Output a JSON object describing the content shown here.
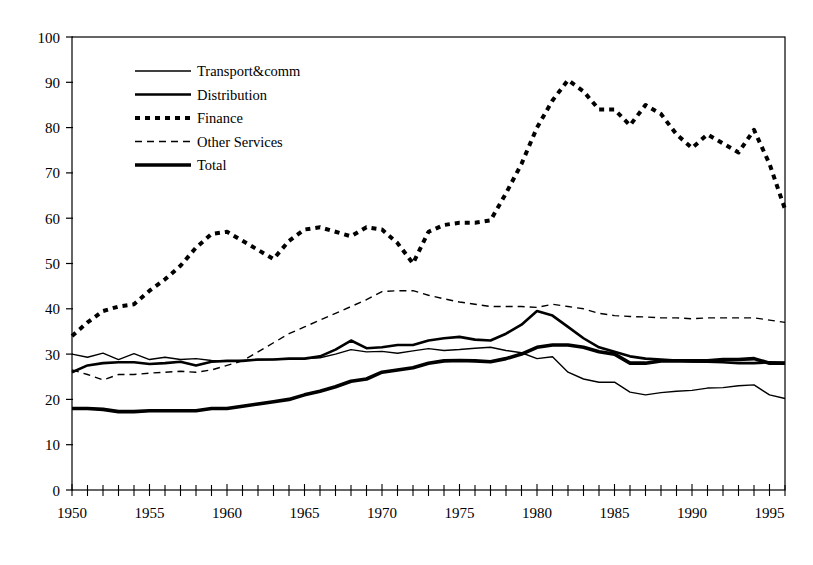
{
  "chart_data": {
    "type": "line",
    "title": "",
    "subtitle": "",
    "xlabel": "",
    "ylabel": "",
    "xlim": [
      1950,
      1996
    ],
    "ylim": [
      0,
      100
    ],
    "grid": false,
    "legend_position": "upper-left-inside",
    "x_tick_labels": [
      "1950",
      "1955",
      "1960",
      "1965",
      "1970",
      "1975",
      "1980",
      "1985",
      "1990",
      "1995"
    ],
    "x_tick_values": [
      1950,
      1955,
      1960,
      1965,
      1970,
      1975,
      1980,
      1985,
      1990,
      1995
    ],
    "x_minor_tick_step": 1,
    "y_tick_labels": [
      "0",
      "10",
      "20",
      "30",
      "40",
      "50",
      "60",
      "70",
      "80",
      "90",
      "100"
    ],
    "y_tick_values": [
      0,
      10,
      20,
      30,
      40,
      50,
      60,
      70,
      80,
      90,
      100
    ],
    "x": [
      1950,
      1951,
      1952,
      1953,
      1954,
      1955,
      1956,
      1957,
      1958,
      1959,
      1960,
      1961,
      1962,
      1963,
      1964,
      1965,
      1966,
      1967,
      1968,
      1969,
      1970,
      1971,
      1972,
      1973,
      1974,
      1975,
      1976,
      1977,
      1978,
      1979,
      1980,
      1981,
      1982,
      1983,
      1984,
      1985,
      1986,
      1987,
      1988,
      1989,
      1990,
      1991,
      1992,
      1993,
      1994,
      1995,
      1996
    ],
    "series": [
      {
        "name": "Transport&comm",
        "style": "solid-thin",
        "color": "#000000",
        "values": [
          30.0,
          29.3,
          30.2,
          28.8,
          30.1,
          28.8,
          29.3,
          28.8,
          29.0,
          28.6,
          28.4,
          28.6,
          28.7,
          28.8,
          28.9,
          29.0,
          29.2,
          30.0,
          31.0,
          30.5,
          30.6,
          30.2,
          30.7,
          31.2,
          30.8,
          31.0,
          31.3,
          31.5,
          30.8,
          30.3,
          29.0,
          29.4,
          26.0,
          24.5,
          23.8,
          23.8,
          21.6,
          21.0,
          21.5,
          21.8,
          22.0,
          22.5,
          22.6,
          23.0,
          23.2,
          21.0,
          20.2
        ]
      },
      {
        "name": "Distribution",
        "style": "solid-medium",
        "color": "#000000",
        "values": [
          26.0,
          27.5,
          28.0,
          28.2,
          28.2,
          27.8,
          28.0,
          28.3,
          27.5,
          28.3,
          28.5,
          28.5,
          28.8,
          28.8,
          29.0,
          29.0,
          29.5,
          31.0,
          33.0,
          31.3,
          31.5,
          32.0,
          32.0,
          33.0,
          33.5,
          33.8,
          33.2,
          33.0,
          34.5,
          36.5,
          39.5,
          38.5,
          36.0,
          33.5,
          31.5,
          30.5,
          29.5,
          29.0,
          28.8,
          28.6,
          28.4,
          28.3,
          28.2,
          28.0,
          28.0,
          28.2,
          28.0
        ]
      },
      {
        "name": "Finance",
        "style": "dotted-thick",
        "color": "#000000",
        "values": [
          34.0,
          37.0,
          39.5,
          40.5,
          41.0,
          44.0,
          46.5,
          49.5,
          53.5,
          56.5,
          57.0,
          55.0,
          53.0,
          51.0,
          55.0,
          57.5,
          58.0,
          57.0,
          56.0,
          58.0,
          57.5,
          54.5,
          50.0,
          57.0,
          58.5,
          59.0,
          59.0,
          59.5,
          65.5,
          72.0,
          80.0,
          86.0,
          90.5,
          88.0,
          84.0,
          84.0,
          80.5,
          85.0,
          83.0,
          78.5,
          75.5,
          78.5,
          76.5,
          74.5,
          79.5,
          72.0,
          62.0
        ]
      },
      {
        "name": "Other Services",
        "style": "dashed-thin",
        "color": "#000000",
        "values": [
          26.5,
          25.5,
          24.3,
          25.5,
          25.5,
          25.8,
          26.0,
          26.2,
          26.0,
          26.5,
          27.5,
          28.5,
          30.5,
          32.5,
          34.5,
          36.0,
          37.5,
          39.0,
          40.5,
          42.0,
          43.8,
          44.0,
          44.0,
          43.0,
          42.2,
          41.5,
          41.0,
          40.5,
          40.5,
          40.5,
          40.3,
          41.0,
          40.5,
          40.0,
          39.0,
          38.5,
          38.3,
          38.2,
          38.0,
          38.0,
          37.8,
          38.0,
          38.0,
          38.0,
          38.0,
          37.5,
          37.0
        ]
      },
      {
        "name": "Total",
        "style": "solid-thick",
        "color": "#000000",
        "values": [
          18.0,
          18.0,
          17.8,
          17.3,
          17.3,
          17.5,
          17.5,
          17.5,
          17.5,
          18.0,
          18.0,
          18.5,
          19.0,
          19.5,
          20.0,
          21.0,
          21.8,
          22.8,
          24.0,
          24.5,
          26.0,
          26.5,
          27.0,
          28.0,
          28.5,
          28.6,
          28.5,
          28.3,
          29.0,
          30.0,
          31.5,
          32.0,
          32.0,
          31.5,
          30.5,
          30.0,
          28.0,
          28.0,
          28.5,
          28.5,
          28.5,
          28.5,
          28.8,
          28.8,
          29.0,
          28.0,
          28.0
        ]
      }
    ],
    "legend_entries": [
      {
        "label": "Transport&comm",
        "style": "solid-thin"
      },
      {
        "label": "Distribution",
        "style": "solid-medium"
      },
      {
        "label": "Finance",
        "style": "dotted-thick"
      },
      {
        "label": "Other Services",
        "style": "dashed-thin"
      },
      {
        "label": "Total",
        "style": "solid-thick"
      }
    ]
  }
}
